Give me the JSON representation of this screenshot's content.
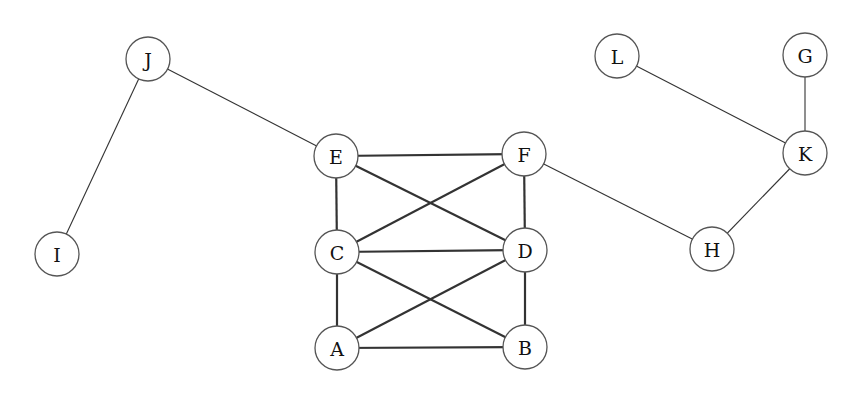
{
  "diagram": {
    "type": "undirected-graph",
    "width": 867,
    "height": 397,
    "node_radius": 22,
    "colors": {
      "background": "#ffffff",
      "node_stroke": "#555555",
      "node_fill": "#ffffff",
      "edge": "#333333",
      "label": "#111111"
    },
    "nodes": [
      {
        "id": "J",
        "label": "J",
        "x": 148,
        "y": 59
      },
      {
        "id": "I",
        "label": "I",
        "x": 57,
        "y": 254
      },
      {
        "id": "E",
        "label": "E",
        "x": 336,
        "y": 156
      },
      {
        "id": "F",
        "label": "F",
        "x": 524,
        "y": 154
      },
      {
        "id": "C",
        "label": "C",
        "x": 337,
        "y": 252
      },
      {
        "id": "D",
        "label": "D",
        "x": 525,
        "y": 250
      },
      {
        "id": "A",
        "label": "A",
        "x": 337,
        "y": 348
      },
      {
        "id": "B",
        "label": "B",
        "x": 525,
        "y": 347
      },
      {
        "id": "L",
        "label": "L",
        "x": 617,
        "y": 56
      },
      {
        "id": "G",
        "label": "G",
        "x": 805,
        "y": 55
      },
      {
        "id": "K",
        "label": "K",
        "x": 805,
        "y": 153
      },
      {
        "id": "H",
        "label": "H",
        "x": 712,
        "y": 249
      }
    ],
    "edges": [
      {
        "from": "J",
        "to": "I",
        "weight": "thin"
      },
      {
        "from": "J",
        "to": "E",
        "weight": "thin"
      },
      {
        "from": "E",
        "to": "F",
        "weight": "thick"
      },
      {
        "from": "E",
        "to": "C",
        "weight": "thick"
      },
      {
        "from": "E",
        "to": "D",
        "weight": "thick"
      },
      {
        "from": "F",
        "to": "C",
        "weight": "thick"
      },
      {
        "from": "F",
        "to": "D",
        "weight": "thick"
      },
      {
        "from": "C",
        "to": "D",
        "weight": "thick"
      },
      {
        "from": "C",
        "to": "A",
        "weight": "thick"
      },
      {
        "from": "C",
        "to": "B",
        "weight": "thick"
      },
      {
        "from": "D",
        "to": "A",
        "weight": "thick"
      },
      {
        "from": "D",
        "to": "B",
        "weight": "thick"
      },
      {
        "from": "A",
        "to": "B",
        "weight": "thick"
      },
      {
        "from": "F",
        "to": "H",
        "weight": "thin"
      },
      {
        "from": "H",
        "to": "K",
        "weight": "thin"
      },
      {
        "from": "L",
        "to": "K",
        "weight": "thin"
      },
      {
        "from": "G",
        "to": "K",
        "weight": "thin"
      }
    ]
  }
}
